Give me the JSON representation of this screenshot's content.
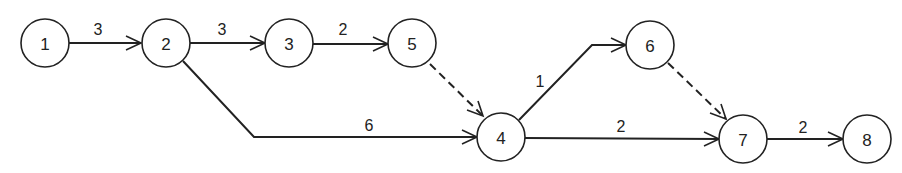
{
  "diagram": {
    "type": "activity-on-arrow network",
    "nodes": [
      {
        "id": "1",
        "label": "1",
        "x": 45,
        "y": 43
      },
      {
        "id": "2",
        "label": "2",
        "x": 166,
        "y": 43
      },
      {
        "id": "3",
        "label": "3",
        "x": 289,
        "y": 43
      },
      {
        "id": "5",
        "label": "5",
        "x": 412,
        "y": 43
      },
      {
        "id": "4",
        "label": "4",
        "x": 501,
        "y": 137
      },
      {
        "id": "6",
        "label": "6",
        "x": 650,
        "y": 45
      },
      {
        "id": "7",
        "label": "7",
        "x": 743,
        "y": 139
      },
      {
        "id": "8",
        "label": "8",
        "x": 867,
        "y": 139
      }
    ],
    "edges": [
      {
        "from": "1",
        "to": "2",
        "label": "3",
        "style": "solid"
      },
      {
        "from": "2",
        "to": "3",
        "label": "3",
        "style": "solid"
      },
      {
        "from": "3",
        "to": "5",
        "label": "2",
        "style": "solid"
      },
      {
        "from": "5",
        "to": "4",
        "label": "",
        "style": "dashed"
      },
      {
        "from": "2",
        "to": "4",
        "label": "6",
        "style": "solid"
      },
      {
        "from": "4",
        "to": "6",
        "label": "1",
        "style": "solid"
      },
      {
        "from": "6",
        "to": "7",
        "label": "",
        "style": "dashed"
      },
      {
        "from": "4",
        "to": "7",
        "label": "2",
        "style": "solid"
      },
      {
        "from": "7",
        "to": "8",
        "label": "2",
        "style": "solid"
      }
    ]
  }
}
